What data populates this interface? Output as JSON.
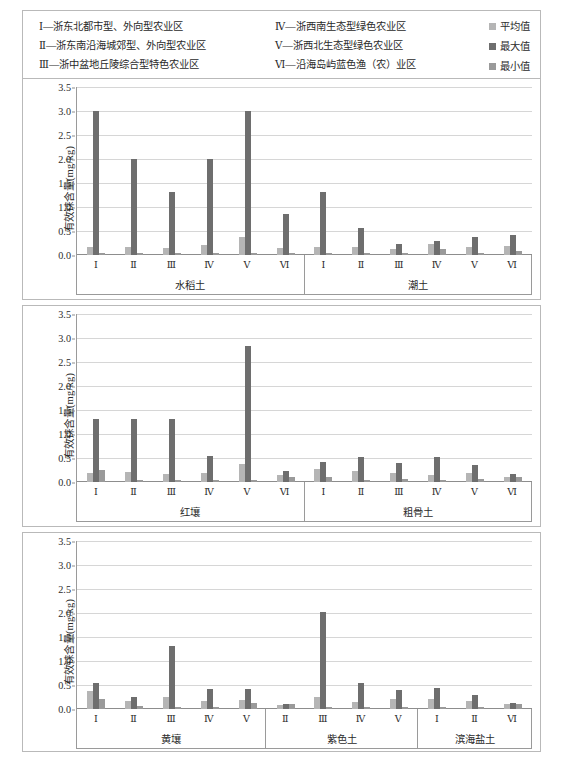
{
  "legend": {
    "categories": [
      "Ⅰ—浙东北都市型、外向型农业区",
      "Ⅳ—浙西南生态型绿色农业区",
      "Ⅱ—浙东南沿海城郊型、外向型农业区",
      "Ⅴ—浙西北生态型绿色农业区",
      "Ⅲ—浙中盆地丘陵综合型特色农业区",
      "Ⅵ—沿海岛屿蓝色渔（农）业区"
    ],
    "series": [
      {
        "label": "平均值",
        "color": "#b5b5b5",
        "key": "mean"
      },
      {
        "label": "最大值",
        "color": "#6e6e6e",
        "key": "max"
      },
      {
        "label": "最小值",
        "color": "#9a9a9a",
        "key": "min"
      }
    ]
  },
  "chart_data": [
    {
      "type": "bar",
      "panel_index": 0,
      "ylabel": "有效铼含量(mg/kg)",
      "ylim": [
        0,
        3.5
      ],
      "yticks": [
        0.0,
        0.5,
        1.0,
        1.5,
        2.0,
        2.5,
        3.0,
        3.5
      ],
      "ytick_labels": [
        "0.0",
        "0.5",
        "1.0",
        "1.5",
        "2.0",
        "2.5",
        "3.0",
        "3.5"
      ],
      "grid": true,
      "legend_position": "top-right (shared)",
      "series_names": [
        "平均值",
        "最大值",
        "最小值"
      ],
      "groups": [
        {
          "name": "水稻土",
          "categories": [
            "Ⅰ",
            "Ⅱ",
            "Ⅲ",
            "Ⅳ",
            "Ⅴ",
            "Ⅵ"
          ],
          "mean": [
            0.17,
            0.17,
            0.14,
            0.2,
            0.37,
            0.15
          ],
          "max": [
            3.0,
            2.0,
            1.32,
            2.0,
            3.0,
            0.85
          ],
          "min": [
            0.01,
            0.03,
            0.01,
            0.02,
            0.01,
            0.02
          ]
        },
        {
          "name": "潮土",
          "categories": [
            "Ⅰ",
            "Ⅱ",
            "Ⅲ",
            "Ⅳ",
            "Ⅴ",
            "Ⅵ"
          ],
          "mean": [
            0.17,
            0.16,
            0.12,
            0.22,
            0.16,
            0.18
          ],
          "max": [
            1.32,
            0.56,
            0.23,
            0.29,
            0.38,
            0.41
          ],
          "min": [
            0.01,
            0.03,
            0.04,
            0.12,
            0.05,
            0.09
          ]
        }
      ]
    },
    {
      "type": "bar",
      "panel_index": 1,
      "ylabel": "有效铼含量(mg/kg)",
      "ylim": [
        0,
        3.5
      ],
      "yticks": [
        0.0,
        0.5,
        1.0,
        1.5,
        2.0,
        2.5,
        3.0,
        3.5
      ],
      "ytick_labels": [
        "0.0",
        "0.5",
        "1.0",
        "1.5",
        "2.0",
        "2.5",
        "3.0",
        "3.5"
      ],
      "grid": true,
      "series_names": [
        "平均值",
        "最大值",
        "最小值"
      ],
      "groups": [
        {
          "name": "红壤",
          "categories": [
            "Ⅰ",
            "Ⅱ",
            "Ⅲ",
            "Ⅳ",
            "Ⅴ",
            "Ⅵ"
          ],
          "mean": [
            0.19,
            0.21,
            0.16,
            0.18,
            0.38,
            0.14
          ],
          "max": [
            1.32,
            1.32,
            1.32,
            0.55,
            2.84,
            0.22
          ],
          "min": [
            0.25,
            0.02,
            0.02,
            0.02,
            0.01,
            0.1
          ]
        },
        {
          "name": "粗骨土",
          "categories": [
            "Ⅰ",
            "Ⅱ",
            "Ⅲ",
            "Ⅳ",
            "Ⅴ",
            "Ⅵ"
          ],
          "mean": [
            0.27,
            0.22,
            0.18,
            0.14,
            0.18,
            0.1
          ],
          "max": [
            0.42,
            0.52,
            0.4,
            0.52,
            0.36,
            0.16
          ],
          "min": [
            0.11,
            0.03,
            0.07,
            0.02,
            0.06,
            0.1
          ]
        }
      ]
    },
    {
      "type": "bar",
      "panel_index": 2,
      "ylabel": "有效铼含量(mg/kg)",
      "ylim": [
        0,
        3.5
      ],
      "yticks": [
        0.0,
        0.5,
        1.0,
        1.5,
        2.0,
        2.5,
        3.0,
        3.5
      ],
      "ytick_labels": [
        "0.0",
        "0.5",
        "1.0",
        "1.5",
        "2.0",
        "2.5",
        "3.0",
        "3.5"
      ],
      "grid": true,
      "series_names": [
        "平均值",
        "最大值",
        "最小值"
      ],
      "groups": [
        {
          "name": "黄壤",
          "categories": [
            "Ⅰ",
            "Ⅱ",
            "Ⅲ",
            "Ⅳ",
            "Ⅴ"
          ],
          "mean": [
            0.38,
            0.17,
            0.26,
            0.16,
            0.19
          ],
          "max": [
            0.54,
            0.25,
            1.32,
            0.42,
            0.41
          ],
          "min": [
            0.2,
            0.07,
            0.02,
            0.02,
            0.12
          ]
        },
        {
          "name": "紫色土",
          "categories": [
            "Ⅱ",
            "Ⅲ",
            "Ⅳ",
            "Ⅴ"
          ],
          "mean": [
            0.09,
            0.26,
            0.15,
            0.2
          ],
          "max": [
            0.1,
            2.02,
            0.55,
            0.4
          ],
          "min": [
            0.1,
            0.04,
            0.02,
            0.03
          ]
        },
        {
          "name": "滨海盐土",
          "categories": [
            "Ⅰ",
            "Ⅱ",
            "Ⅵ"
          ],
          "mean": [
            0.21,
            0.16,
            0.11
          ],
          "max": [
            0.43,
            0.3,
            0.13
          ],
          "min": [
            0.02,
            0.02,
            0.1
          ]
        }
      ]
    }
  ]
}
